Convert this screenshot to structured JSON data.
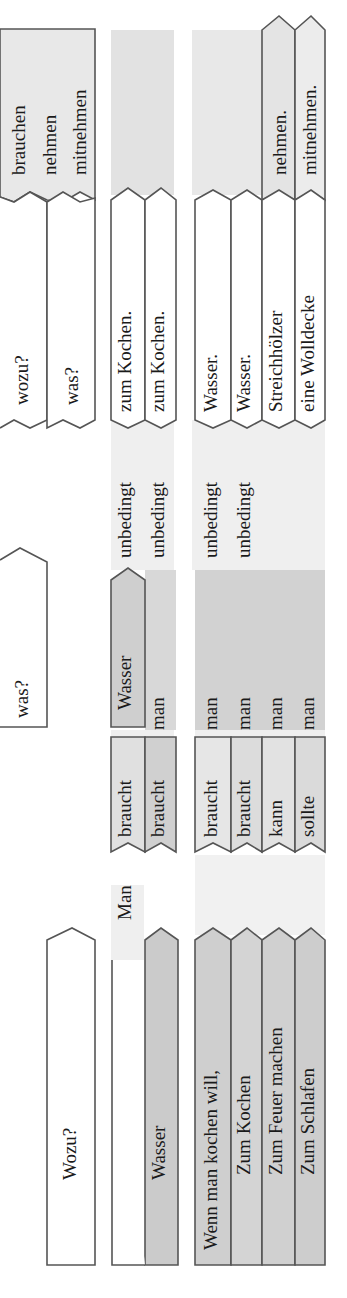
{
  "diagram": {
    "orientation": "rotated-90-ccw",
    "colors": {
      "outline": "#555555",
      "dark_tile": "#c8c8c8",
      "light_band": "#ececec",
      "mid_band": "#dadada",
      "white_tile": "#ffffff"
    },
    "header": {
      "question_1": "Wozu?",
      "question_2": "was?",
      "question_3": "wozu?",
      "question_4": "was?",
      "verbs": [
        "brauchen",
        "nehmen",
        "mitnehmen"
      ]
    },
    "group_1": {
      "subject": "Man",
      "rows": [
        {
          "verb": "braucht",
          "object": "Wasser",
          "adverb": "unbedingt",
          "purpose": "zum Kochen."
        },
        {
          "pre": "Wasser",
          "verb": "braucht",
          "subject": "man",
          "adverb": "unbedingt",
          "purpose": "zum Kochen."
        }
      ]
    },
    "group_2": {
      "rows": [
        {
          "pre": "Wenn man kochen will,",
          "verb": "braucht",
          "subject": "man",
          "adverb": "unbedingt",
          "object": "Wasser."
        },
        {
          "pre": "Zum Kochen",
          "verb": "braucht",
          "subject": "man",
          "adverb": "unbedingt",
          "object": "Wasser."
        },
        {
          "pre": "Zum Feuer machen",
          "verb": "kann",
          "subject": "man",
          "adverb": "",
          "object": "Streichhölzer",
          "infinitive": "nehmen."
        },
        {
          "pre": "Zum Schlafen",
          "verb": "sollte",
          "subject": "man",
          "adverb": "",
          "object": "eine Wolldecke",
          "infinitive": "mitnehmen."
        }
      ]
    }
  }
}
